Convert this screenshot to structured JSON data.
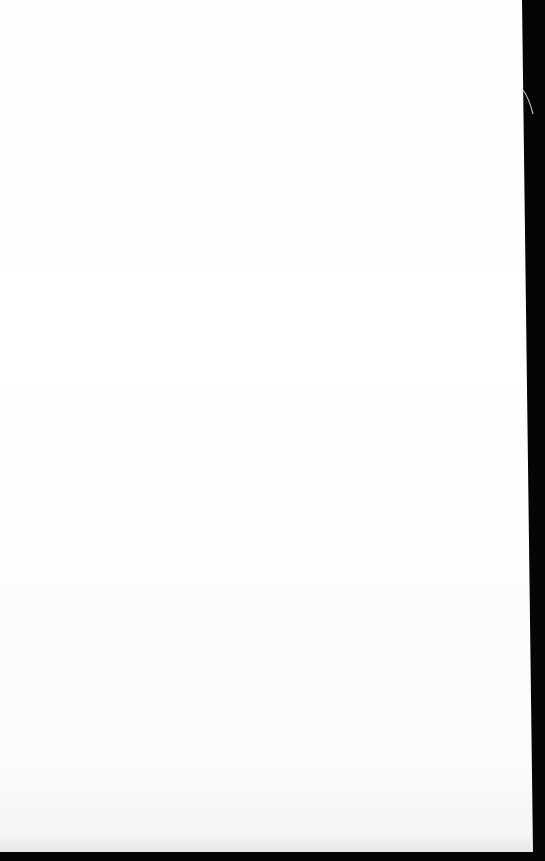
{
  "scene": {
    "description": "Photograph of a blank white sheet of paper against a dark background",
    "paper_color": "#ffffff",
    "background_color": "#050505",
    "text_content": []
  }
}
